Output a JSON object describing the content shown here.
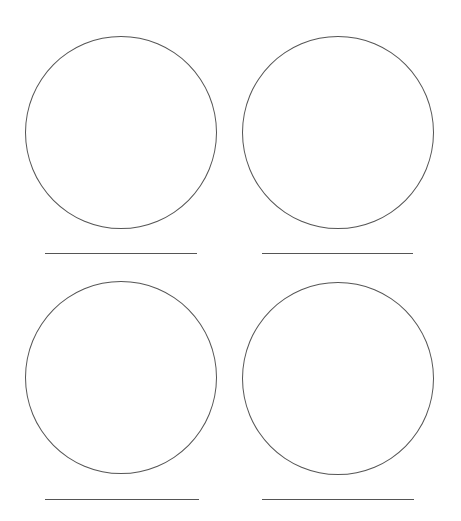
{
  "diagram": {
    "stroke_color": "#555555",
    "background": "#ffffff",
    "items": [
      {
        "id": "top-left",
        "circle": {
          "cx": 120,
          "cy": 132,
          "r": 96
        },
        "line": {
          "x1": 45,
          "x2": 197,
          "y": 253
        }
      },
      {
        "id": "top-right",
        "circle": {
          "cx": 338,
          "cy": 132,
          "r": 96
        },
        "line": {
          "x1": 262,
          "x2": 413,
          "y": 253
        }
      },
      {
        "id": "bottom-left",
        "circle": {
          "cx": 120,
          "cy": 377,
          "r": 96
        },
        "line": {
          "x1": 45,
          "x2": 199,
          "y": 499
        }
      },
      {
        "id": "bottom-right",
        "circle": {
          "cx": 338,
          "cy": 378,
          "r": 96
        },
        "line": {
          "x1": 262,
          "x2": 414,
          "y": 499
        }
      }
    ]
  }
}
